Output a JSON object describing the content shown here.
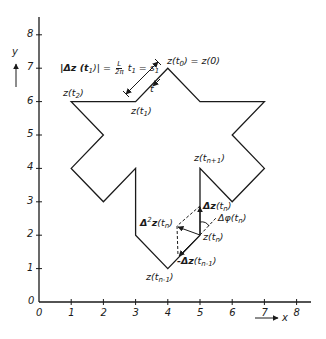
{
  "figure": {
    "type": "diagram"
  },
  "axes": {
    "x_label": "x",
    "y_label": "y",
    "origin_label": "0",
    "x_ticks": [
      "0",
      "1",
      "2",
      "3",
      "4",
      "5",
      "6",
      "7",
      "8"
    ],
    "y_ticks": [
      "0",
      "1",
      "2",
      "3",
      "4",
      "5",
      "6",
      "7",
      "8"
    ],
    "x_range": [
      0,
      8.5
    ],
    "y_range": [
      0,
      8.5
    ]
  },
  "polygon": {
    "vertices": [
      [
        4,
        7
      ],
      [
        5,
        6
      ],
      [
        7,
        6
      ],
      [
        6,
        5
      ],
      [
        7,
        4
      ],
      [
        6,
        3
      ],
      [
        5,
        4
      ],
      [
        5,
        2
      ],
      [
        4,
        1
      ],
      [
        3,
        2
      ],
      [
        3,
        4
      ],
      [
        2,
        3
      ],
      [
        1,
        4
      ],
      [
        2,
        5
      ],
      [
        1,
        6
      ],
      [
        3,
        6
      ]
    ],
    "color": "#1a1a1a"
  },
  "labels": {
    "z_t0": {
      "main": "z(t",
      "sub": "0",
      "tail": ") = z(0)"
    },
    "z_t1": {
      "main": "z(t",
      "sub": "1",
      "tail": ")"
    },
    "z_t2": {
      "main": "z(t",
      "sub": "2",
      "tail": ")"
    },
    "z_tn1p": {
      "main": "z(t",
      "sub": "n+1",
      "tail": ")"
    },
    "z_tn": {
      "main": "z(t",
      "sub": "n",
      "tail": ")"
    },
    "z_tn1m": {
      "main": "z(t",
      "sub": "n-1",
      "tail": ")"
    },
    "t": "t",
    "delta_z_tn": {
      "main": "Δz",
      "paren": "(t",
      "sub": "n",
      "tail": ")"
    },
    "delta2_z_tn": {
      "main": "Δ",
      "sup": "2",
      "main2": "z",
      "paren": "(t",
      "sub": "n",
      "tail": ")"
    },
    "delta_phi_tn": {
      "main": "Δφ(t",
      "sub": "n",
      "tail": ")"
    },
    "neg_delta_z_tn1": {
      "main": "-Δz",
      "paren": "(t",
      "sub": "n-1",
      "tail": ")"
    },
    "formula": {
      "lhs": "|Δz (t",
      "lhs_sub": "1",
      "lhs_tail": ")| =",
      "frac_num": "L",
      "frac_den": "2π",
      "rhs": "t",
      "rhs_sub": "1",
      "rhs_tail": " = s",
      "rhs_sub2": "1"
    }
  }
}
